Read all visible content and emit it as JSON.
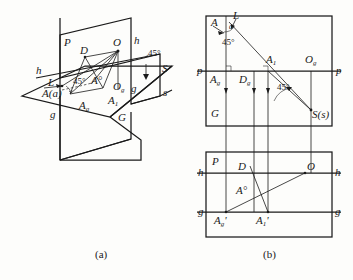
{
  "figure": {
    "caption_a": "(a)",
    "caption_b": "(b)",
    "accent_color": "#1a1a1a",
    "background_color": "#fdfdfb"
  },
  "diagram_a": {
    "name": "pictorial-view",
    "labels": {
      "plane_P": "P",
      "plane_G": "G",
      "point_D": "D",
      "point_O": "O",
      "point_O_g": "O",
      "point_O_g_sub": "g",
      "point_A": "A",
      "point_A_paren": "(a)",
      "point_A_circ": "A°",
      "point_A_g": "A",
      "point_A_g_sub": "g",
      "point_A_1": "A",
      "point_A_1_sub": "1",
      "axis_h_left": "h",
      "axis_h_right": "h",
      "axis_g_left": "g",
      "axis_g_right": "g",
      "axis_s_right": "s",
      "point_S": "S",
      "ray_L": "L",
      "angle_45_left": "45°",
      "angle_45_right": "45°"
    }
  },
  "diagram_b_top": {
    "name": "horizontal-projection",
    "labels": {
      "point_A": "A",
      "ray_L": "L",
      "angle_alpha": "a",
      "angle_45_upper": "45°",
      "angle_45_lower": "45°",
      "point_A_1": "A",
      "point_A_1_sub": "1",
      "point_O_g": "O",
      "point_O_g_sub": "g",
      "point_A_g": "A",
      "point_A_g_sub": "g",
      "point_D_g": "D",
      "point_D_g_sub": "g",
      "plane_G": "G",
      "axis_p_left": "p",
      "axis_p_right": "p",
      "point_S": "S(s)"
    }
  },
  "diagram_b_bottom": {
    "name": "frontal-projection",
    "labels": {
      "plane_P": "P",
      "point_D": "D",
      "point_O": "O",
      "point_A_circ": "A°",
      "point_A_g_prime": "A",
      "point_A_g_prime_sub": "g",
      "point_A_g_prime_tick": "'",
      "point_A_1_prime": "A",
      "point_A_1_prime_sub": "1",
      "point_A_1_prime_tick": "'",
      "axis_h_left": "h",
      "axis_h_right": "h",
      "axis_g_left": "g",
      "axis_g_right": "g"
    }
  }
}
